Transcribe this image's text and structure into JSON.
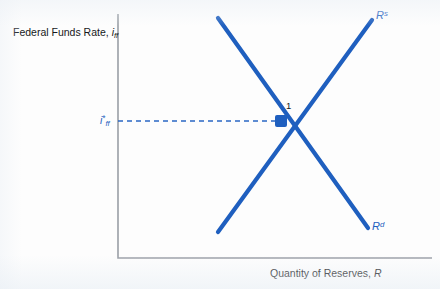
{
  "figure": {
    "axes": {
      "y_title_prefix": "Federal Funds Rate, ",
      "y_title_symbol": "i",
      "y_title_subscript": "ff",
      "x_title_prefix": "Quantity of Reserves, ",
      "x_title_symbol": "R"
    },
    "curves": {
      "supply_symbol": "R",
      "supply_superscript": "s",
      "demand_symbol": "R",
      "demand_superscript": "d"
    },
    "equilibrium": {
      "point_label": "1",
      "rate_symbol": "i",
      "rate_star": "*",
      "rate_subscript": "ff"
    },
    "colors": {
      "curve_blue": "#1f5fbf",
      "dash_blue": "#2a67c4",
      "axis_gray": "#9a9fa6",
      "text_black": "#16181b",
      "background": "#fdfdfd"
    }
  },
  "chart_data": {
    "type": "line",
    "title": "",
    "xlabel": "Quantity of Reserves, R",
    "ylabel": "Federal Funds Rate, i_ff",
    "grid": false,
    "legend": "inline-curve-labels",
    "axis_origin_px": [
      118,
      258
    ],
    "xlim_px": [
      118,
      432
    ],
    "ylim_px": [
      258,
      14
    ],
    "series": [
      {
        "name": "R^s",
        "label": "Reserve supply",
        "slope": "upward",
        "points_px": [
          [
            218,
            232
          ],
          [
            372,
            20
          ]
        ],
        "label_position_px": [
          376,
          9
        ]
      },
      {
        "name": "R^d",
        "label": "Reserve demand",
        "slope": "downward",
        "points_px": [
          [
            218,
            18
          ],
          [
            368,
            228
          ]
        ],
        "label_position_px": [
          372,
          220
        ]
      }
    ],
    "annotations": [
      {
        "name": "equilibrium-point",
        "text": "1",
        "point_px": [
          281,
          121
        ],
        "label_px": [
          286,
          100
        ]
      },
      {
        "name": "equilibrium-rate-dashed-line",
        "from_px": [
          118,
          121
        ],
        "to_px": [
          281,
          121
        ],
        "style": "dashed"
      }
    ]
  }
}
